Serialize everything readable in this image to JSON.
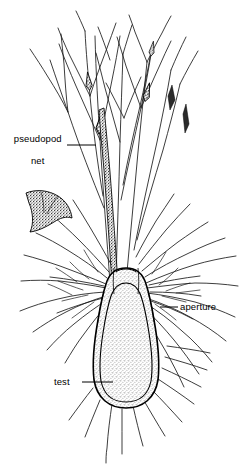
{
  "figure": {
    "background_color": "#ffffff",
    "ink_color": "#000000",
    "stipple_color": "#8a8a8a",
    "width": 247,
    "height": 464
  },
  "labels": [
    {
      "id": "pseudopod-net",
      "text": "pseudopod\nnet",
      "line1": "pseudopod",
      "line2": "net",
      "x": 35,
      "y": 133,
      "leader": {
        "x1": 67,
        "y1": 145,
        "x2": 96,
        "y2": 145
      }
    },
    {
      "id": "aperture",
      "text": "aperture",
      "x": 180,
      "y": 307,
      "leader": {
        "x1": 160,
        "y1": 307,
        "x2": 178,
        "y2": 307
      }
    },
    {
      "id": "test",
      "text": "test",
      "x": 56,
      "y": 382,
      "leader": {
        "x1": 82,
        "y1": 382,
        "x2": 113,
        "y2": 382
      }
    }
  ],
  "structures": {
    "test": {
      "name": "test",
      "description": "pear-shaped stippled flask-like shell with double outline",
      "center_x": 126,
      "center_y": 340,
      "width": 62,
      "height": 135
    },
    "aperture": {
      "name": "aperture",
      "description": "neck opening at top of test from which pseudopodia emerge",
      "x": 126,
      "y": 282
    },
    "pseudopod_net": {
      "name": "pseudopod net",
      "description": "branching anastomosing reticulate filaments with granule nodes",
      "filament_count": 54,
      "node_count": 6
    }
  }
}
